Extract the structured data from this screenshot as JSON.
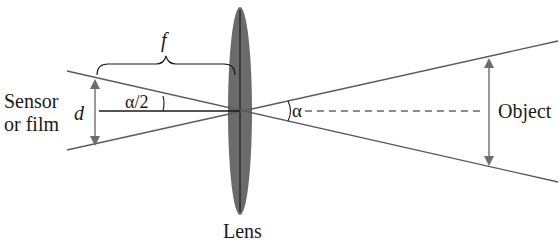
{
  "diagram": {
    "labels": {
      "sensor_line1": "Sensor",
      "sensor_line2": "or film",
      "d": "d",
      "f": "f",
      "half_angle": "α/2",
      "angle": "α",
      "object": "Object",
      "lens": "Lens"
    },
    "colors": {
      "lens_fill": "#6b6b6b",
      "ray": "#5a5a5a",
      "arrow": "#6e6e6e",
      "axis": "#1a1a1a",
      "text": "#1a1a1a",
      "background": "#ffffff"
    }
  }
}
